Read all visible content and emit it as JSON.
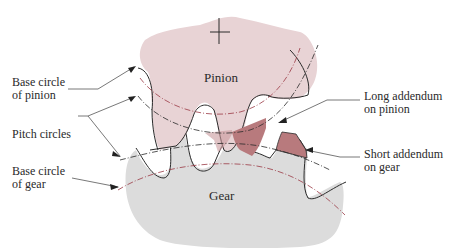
{
  "diagram": {
    "bodies": {
      "pinion": {
        "label": "Pinion",
        "fill": "#e8d3d5"
      },
      "gear": {
        "label": "Gear",
        "fill": "#dcdcdc"
      }
    },
    "addendum_fill": "#b87a7d",
    "circle_line_color": "#9a3a45",
    "labels": {
      "base_circle_pinion": {
        "line1": "Base circle",
        "line2": "of pinion"
      },
      "pitch_circles": {
        "line1": "Pitch circles"
      },
      "base_circle_gear": {
        "line1": "Base circle",
        "line2": "of gear"
      },
      "long_addendum": {
        "line1": "Long addendum",
        "line2": "on pinion"
      },
      "short_addendum": {
        "line1": "Short addendum",
        "line2": "on gear"
      }
    }
  }
}
